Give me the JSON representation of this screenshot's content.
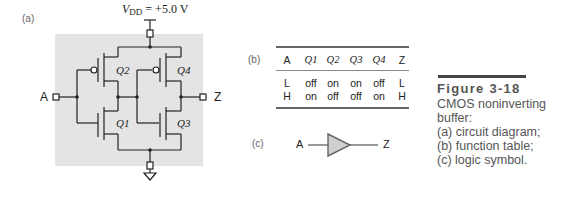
{
  "figure": {
    "number": "Figure 3-18",
    "caption_lines": [
      "CMOS noninverting",
      "buffer:",
      "(a) circuit diagram;",
      "(b) function table;",
      "(c) logic symbol."
    ]
  },
  "panel_a": {
    "label": "(a)",
    "supply": {
      "symbol": "V",
      "subscript": "DD",
      "value": "= +5.0 V"
    },
    "input_label": "A",
    "output_label": "Z",
    "transistors": [
      {
        "name": "Q1",
        "type": "nMOS",
        "stage": 1
      },
      {
        "name": "Q2",
        "type": "pMOS",
        "stage": 1
      },
      {
        "name": "Q3",
        "type": "nMOS",
        "stage": 2
      },
      {
        "name": "Q4",
        "type": "pMOS",
        "stage": 2
      }
    ],
    "colors": {
      "background": "#e4e4e4",
      "wire": "#222222"
    }
  },
  "panel_b": {
    "label": "(b)",
    "headers": [
      "A",
      "Q1",
      "Q2",
      "Q3",
      "Q4",
      "Z"
    ],
    "rows": [
      [
        "L",
        "off",
        "on",
        "on",
        "off",
        "L"
      ],
      [
        "H",
        "on",
        "off",
        "off",
        "on",
        "H"
      ]
    ]
  },
  "panel_c": {
    "label": "(c)",
    "input_label": "A",
    "output_label": "Z",
    "symbol": "buffer-triangle",
    "colors": {
      "fill": "#cfcfcf",
      "stroke": "#666666"
    }
  }
}
